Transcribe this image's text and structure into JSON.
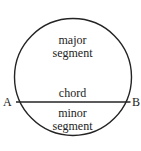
{
  "figure": {
    "type": "circle-segment-diagram",
    "canvas": {
      "width": 141,
      "height": 151,
      "background": "#ffffff"
    },
    "stroke_color": "#242424",
    "text_color": "#222222",
    "circle": {
      "center_x": 73,
      "center_y": 77,
      "radius": 59
    },
    "chord": {
      "y": 102,
      "x_start": 16,
      "x_end": 130
    },
    "labels": {
      "major_segment_line1": "major",
      "major_segment_line2": "segment",
      "chord": "chord",
      "minor_segment_line1": "minor",
      "minor_segment_line2": "segment",
      "point_a": "A",
      "point_b": "B"
    }
  }
}
